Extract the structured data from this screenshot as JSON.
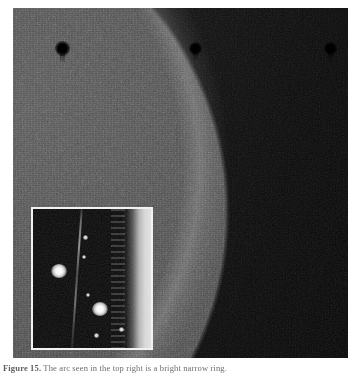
{
  "figure": {
    "caption_label": "Figure 15.",
    "caption_text": "The arc seen in the top right is a bright narrow ring.",
    "alt_main": "grayscale-astronomical-image",
    "alt_inset": "magnified-inset-detail"
  },
  "main_image": {
    "name": "main-plate",
    "features": {
      "arc_label": "bright-narrow-arc",
      "background_label": "noisy-grey-field",
      "interior_label": "dark-interior-region"
    },
    "dark_spots": [
      {
        "name": "dark-spot-1",
        "x": 49,
        "y": 40,
        "r": 7
      },
      {
        "name": "dark-spot-2",
        "x": 182,
        "y": 40,
        "r": 6
      },
      {
        "name": "dark-spot-3",
        "x": 317,
        "y": 40,
        "r": 6
      }
    ]
  },
  "inset": {
    "name": "inset-panel",
    "border_color": "#f2f2f2",
    "background_color": "#070707",
    "blobs": [
      {
        "name": "inset-blob-left",
        "x": 25,
        "y": 62,
        "size": 15
      },
      {
        "name": "inset-blob-right",
        "x": 66,
        "y": 100,
        "size": 15
      }
    ],
    "mini_blobs": [
      {
        "name": "inset-mini-blob-1",
        "x": 52,
        "y": 28,
        "size": 5
      },
      {
        "name": "inset-mini-blob-2",
        "x": 55,
        "y": 86,
        "size": 4
      },
      {
        "name": "inset-mini-blob-3",
        "x": 63,
        "y": 126,
        "size": 5
      },
      {
        "name": "inset-mini-blob-4",
        "x": 88,
        "y": 120,
        "size": 5
      },
      {
        "name": "inset-mini-blob-5",
        "x": 50,
        "y": 48,
        "size": 3
      }
    ],
    "streak_label": "faint-vertical-streak",
    "band_label": "bright-right-edge-band"
  },
  "colors": {
    "page_background": "#ffffff",
    "field_light": "#4a4a4a",
    "field_dark": "#121212",
    "arc_white": "#ffffff",
    "caption_text": "#6d6d6d"
  }
}
